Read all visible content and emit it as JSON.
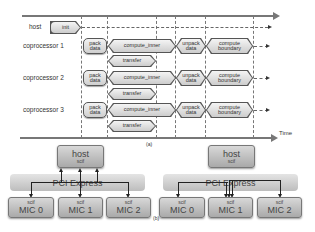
{
  "timeline": {
    "caption": "(a)",
    "axis_label": "Time",
    "rows": [
      {
        "label": "host",
        "tasks": [
          {
            "name": "init"
          }
        ]
      },
      {
        "label": "coprocessor 1",
        "tasks": [
          {
            "name": "pack_data",
            "line1": "pack",
            "line2": "data"
          },
          {
            "name": "compute_inner",
            "text": "compute_inner"
          },
          {
            "name": "unpack_data",
            "line1": "unpack",
            "line2": "data"
          },
          {
            "name": "compute_boundary",
            "line1": "compute",
            "line2": "boundary"
          },
          {
            "name": "transfer",
            "text": "transfer"
          }
        ]
      },
      {
        "label": "coprocessor 2",
        "tasks": [
          {
            "name": "pack_data",
            "line1": "pack",
            "line2": "data"
          },
          {
            "name": "compute_inner",
            "text": "compute_inner"
          },
          {
            "name": "unpack_data",
            "line1": "unpack",
            "line2": "data"
          },
          {
            "name": "compute_boundary",
            "line1": "compute",
            "line2": "boundary"
          },
          {
            "name": "transfer",
            "text": "transfer"
          }
        ]
      },
      {
        "label": "coprocessor 3",
        "tasks": [
          {
            "name": "pack_data",
            "line1": "pack",
            "line2": "data"
          },
          {
            "name": "compute_inner",
            "text": "compute_inner"
          },
          {
            "name": "unpack_data",
            "line1": "unpack",
            "line2": "data"
          },
          {
            "name": "compute_boundary",
            "line1": "compute",
            "line2": "boundary"
          },
          {
            "name": "transfer",
            "text": "transfer"
          }
        ]
      }
    ]
  },
  "topology": {
    "caption": "(b)",
    "host": {
      "title": "host",
      "sub": "scif"
    },
    "bus": "PCI Express",
    "mics": [
      {
        "sub": "scif",
        "title": "MIC 0"
      },
      {
        "sub": "scif",
        "title": "MIC 1"
      },
      {
        "sub": "scif",
        "title": "MIC 2"
      }
    ]
  }
}
